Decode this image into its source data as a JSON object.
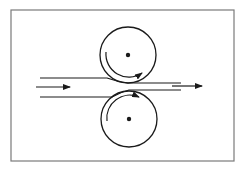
{
  "diagram": {
    "colors": {
      "stroke": "#1a1a1a",
      "frame": "#7a7a7a",
      "background": "#ffffff"
    },
    "frame": {
      "x": 11,
      "y": 10,
      "width": 223,
      "height": 151
    },
    "rollers": [
      {
        "name": "top-roller",
        "cx": 128,
        "cy": 55,
        "r": 28,
        "rotation": "counterclockwise"
      },
      {
        "name": "bottom-roller",
        "cx": 129,
        "cy": 119,
        "r": 28,
        "rotation": "clockwise"
      }
    ],
    "strip": {
      "incoming_top_y": 78,
      "incoming_bottom_y": 97,
      "outgoing_top_y": 83,
      "outgoing_bottom_y": 90
    },
    "arrows": {
      "input": {
        "x1": 36,
        "x2": 70,
        "y": 87,
        "label": "feed direction"
      },
      "output": {
        "x1": 172,
        "x2": 202,
        "y": 86,
        "label": "exit direction"
      }
    }
  }
}
